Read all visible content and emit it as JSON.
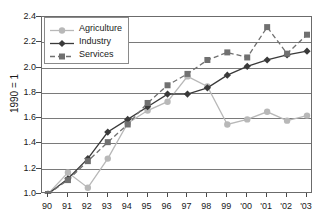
{
  "chart_data": {
    "type": "line",
    "title": "",
    "xlabel": "",
    "ylabel": "1990 = 1",
    "x": [
      "90",
      "91",
      "92",
      "93",
      "94",
      "95",
      "96",
      "97",
      "98",
      "99",
      "'00",
      "'01",
      "'02",
      "'03"
    ],
    "xtick_labels": [
      "90",
      "91",
      "92",
      "93",
      "94",
      "95",
      "96",
      "97",
      "98",
      "99",
      "'00",
      "'01",
      "'02",
      "'03"
    ],
    "ytick_labels": [
      "1.0",
      "1.2",
      "1.4",
      "1.6",
      "1.8",
      "2.0",
      "2.2",
      "2.4"
    ],
    "ytick_values": [
      1.0,
      1.2,
      1.4,
      1.6,
      1.8,
      2.0,
      2.2,
      2.4
    ],
    "ylim": [
      1.0,
      2.4
    ],
    "grid": true,
    "legend_position": "top-left",
    "series": [
      {
        "name": "Agriculture",
        "color": "#b8b8b8",
        "marker": "circle",
        "linestyle": "solid",
        "values": [
          1.0,
          1.17,
          1.05,
          1.28,
          1.56,
          1.66,
          1.73,
          1.93,
          1.85,
          1.55,
          1.59,
          1.65,
          1.58,
          1.62
        ]
      },
      {
        "name": "Industry",
        "color": "#3a3a3a",
        "marker": "diamond",
        "linestyle": "solid",
        "values": [
          1.0,
          1.12,
          1.28,
          1.49,
          1.59,
          1.69,
          1.79,
          1.79,
          1.84,
          1.94,
          2.01,
          2.06,
          2.1,
          2.13
        ]
      },
      {
        "name": "Services",
        "color": "#707070",
        "marker": "square",
        "linestyle": "dashed",
        "values": [
          1.0,
          1.11,
          1.26,
          1.41,
          1.55,
          1.72,
          1.86,
          1.95,
          2.06,
          2.12,
          2.08,
          2.32,
          2.11,
          2.26
        ]
      }
    ]
  }
}
